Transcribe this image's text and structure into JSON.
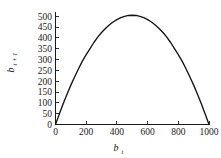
{
  "chart_data": {
    "type": "line",
    "title": "",
    "subtitle": "",
    "xlabel": "b",
    "xlabel_sub": "t",
    "ylabel": "b",
    "ylabel_sub": "t + 1",
    "xlim": [
      0,
      1000
    ],
    "ylim": [
      0,
      520
    ],
    "grid": false,
    "legend": null,
    "line_color": "#141414",
    "background_color": "#ffffff",
    "axis_color": "#1a1a1a",
    "x_ticks": [
      0,
      200,
      400,
      600,
      800,
      1000
    ],
    "x_tick_labels": [
      "0",
      "200",
      "400",
      "600",
      "800",
      "1000"
    ],
    "x_minor_ticks": [
      100,
      300,
      500,
      700,
      900
    ],
    "y_ticks": [
      0,
      50,
      100,
      150,
      200,
      250,
      300,
      350,
      400,
      450,
      500
    ],
    "y_tick_labels": [
      "0",
      "50",
      "100",
      "150",
      "200",
      "250",
      "300",
      "350",
      "400",
      "450",
      "500"
    ],
    "peak": {
      "x": 500,
      "y": 505
    },
    "x": [
      0,
      25,
      50,
      75,
      100,
      125,
      150,
      175,
      200,
      225,
      250,
      275,
      300,
      325,
      350,
      375,
      400,
      425,
      450,
      475,
      500,
      525,
      550,
      575,
      600,
      625,
      650,
      675,
      700,
      725,
      750,
      775,
      800,
      825,
      850,
      875,
      900,
      925,
      950,
      975,
      1000
    ],
    "y": [
      0,
      49,
      96,
      140,
      182,
      221,
      258,
      293,
      323,
      351,
      379,
      404,
      425,
      444,
      460,
      474,
      485,
      494,
      500,
      504,
      505,
      504,
      500,
      494,
      485,
      474,
      460,
      444,
      425,
      404,
      379,
      351,
      323,
      293,
      258,
      221,
      182,
      140,
      96,
      49,
      0
    ]
  }
}
